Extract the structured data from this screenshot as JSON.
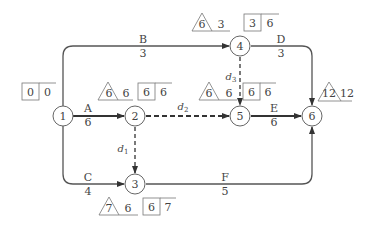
{
  "diagram": {
    "type": "network-double-code-time-parameter",
    "colors": {
      "line": "#555555",
      "text": "#444444",
      "background": "#ffffff"
    },
    "nodes": [
      {
        "id": "1",
        "label": "1",
        "x": 63,
        "y": 116
      },
      {
        "id": "2",
        "label": "2",
        "x": 135,
        "y": 116
      },
      {
        "id": "3",
        "label": "3",
        "x": 135,
        "y": 184
      },
      {
        "id": "4",
        "label": "4",
        "x": 240,
        "y": 46
      },
      {
        "id": "5",
        "label": "5",
        "x": 240,
        "y": 116
      },
      {
        "id": "6",
        "label": "6",
        "x": 312,
        "y": 116
      }
    ],
    "activities": [
      {
        "name": "A",
        "duration": "6",
        "from": "1",
        "to": "2",
        "critical": true
      },
      {
        "name": "B",
        "duration": "3",
        "from": "1",
        "to": "4",
        "critical": false
      },
      {
        "name": "C",
        "duration": "4",
        "from": "1",
        "to": "3",
        "critical": false
      },
      {
        "name": "D",
        "duration": "3",
        "from": "4",
        "to": "6",
        "critical": false
      },
      {
        "name": "E",
        "duration": "6",
        "from": "5",
        "to": "6",
        "critical": true
      },
      {
        "name": "F",
        "duration": "5",
        "from": "3",
        "to": "6",
        "critical": false
      }
    ],
    "dummies": [
      {
        "name": "d",
        "sub": "1",
        "from": "2",
        "to": "3"
      },
      {
        "name": "d",
        "sub": "2",
        "from": "2",
        "to": "5"
      },
      {
        "name": "d",
        "sub": "3",
        "from": "4",
        "to": "5"
      }
    ],
    "node_params": [
      {
        "node": "1",
        "box": [
          "0",
          "0"
        ]
      },
      {
        "node": "2",
        "triangle": "6",
        "tri_side": "6",
        "box": [
          "6",
          "6"
        ]
      },
      {
        "node": "3",
        "triangle": "7",
        "tri_side": "6",
        "box": [
          "6",
          "7"
        ]
      },
      {
        "node": "4",
        "triangle": "6",
        "tri_side": "3",
        "box": [
          "3",
          "6"
        ]
      },
      {
        "node": "5",
        "triangle": "6",
        "tri_side": "6",
        "box": [
          "6",
          "6"
        ]
      },
      {
        "node": "6",
        "triangle": "12",
        "tri_side": "12"
      }
    ]
  }
}
